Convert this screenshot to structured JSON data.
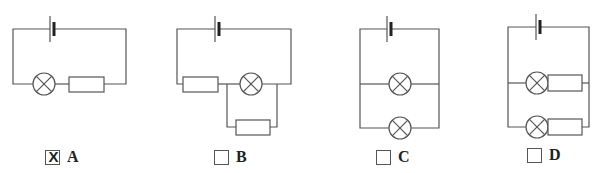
{
  "figure": {
    "title_fragment": "",
    "circuits": [
      {
        "id": "A",
        "description": "Battery in series with lamp and resistor"
      },
      {
        "id": "B",
        "description": "Battery, resistor in series with lamp which is parallel to a resistor"
      },
      {
        "id": "C",
        "description": "Battery with two lamps in parallel"
      },
      {
        "id": "D",
        "description": "Battery with two parallel branches each containing lamp and resistor"
      }
    ]
  },
  "options": [
    {
      "label": "A",
      "checked": true,
      "mark": "X"
    },
    {
      "label": "B",
      "checked": false,
      "mark": ""
    },
    {
      "label": "C",
      "checked": false,
      "mark": ""
    },
    {
      "label": "D",
      "checked": false,
      "mark": ""
    }
  ],
  "colors": {
    "wire": "#555555",
    "text": "#222222",
    "background": "#ffffff"
  }
}
